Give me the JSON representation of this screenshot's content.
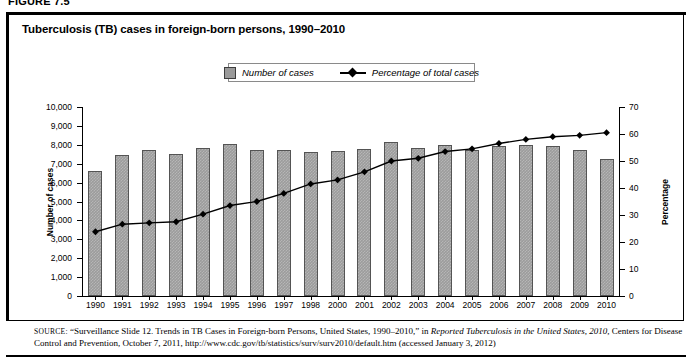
{
  "figure": {
    "number_label": "FIGURE 7.5",
    "title": "Tuberculosis (TB) cases in foreign-born persons, 1990–2010"
  },
  "legend": {
    "items": [
      {
        "label": "Number of cases",
        "marker": "gray-square",
        "color": "#9c9c9c"
      },
      {
        "label": "Percentage of total cases",
        "marker": "black-diamond-line",
        "color": "#000000"
      }
    ]
  },
  "axes": {
    "left_title": "Number of cases",
    "right_title": "Percentage",
    "left_ticks": [
      "10,000",
      "9,000",
      "8,000",
      "7,000",
      "6,000",
      "5,000",
      "4,000",
      "3,000",
      "2,000",
      "1,000",
      "0"
    ],
    "right_ticks": [
      "70",
      "60",
      "50",
      "40",
      "30",
      "20",
      "10",
      "0"
    ]
  },
  "source": {
    "label": "SOURCE:",
    "text_1": "“Surveillance Slide 12. Trends in TB Cases in Foreign-born Persons, United States, 1990–2010,” in ",
    "italic_1": "Reported Tuberculosis in the United States, 2010,",
    "text_2": " Centers for Disease Control and Prevention, October 7, 2011, http://www.cdc.gov/tb/statistics/surv/surv2010/default.htm (accessed January 3, 2012)"
  },
  "chart_data": {
    "type": "bar",
    "title": "Tuberculosis (TB) cases in foreign-born persons, 1990–2010",
    "xlabel": "",
    "ylabel": "Number of cases",
    "y2label": "Percentage",
    "ylim": [
      0,
      10000
    ],
    "y2lim": [
      0,
      70
    ],
    "grid": false,
    "legend_position": "top-center",
    "categories": [
      "1990",
      "1991",
      "1992",
      "1993",
      "1994",
      "1995",
      "1996",
      "1997",
      "1998",
      "2000",
      "2001",
      "2002",
      "2003",
      "2004",
      "2005",
      "2006",
      "2007",
      "2008",
      "2009",
      "2010"
    ],
    "series": [
      {
        "name": "Number of cases",
        "type": "bar",
        "axis": "left",
        "color": "#9c9c9c",
        "values": [
          6600,
          7450,
          7700,
          7500,
          7850,
          8050,
          7750,
          7700,
          7600,
          7650,
          7800,
          8150,
          7850,
          8000,
          7700,
          7950,
          8000,
          7950,
          7750,
          7250
        ]
      },
      {
        "name": "Percentage of total cases",
        "type": "line",
        "axis": "right",
        "color": "#000000",
        "values": [
          23.8,
          26.6,
          27.1,
          27.5,
          30.3,
          33.5,
          35.0,
          38.0,
          41.5,
          43.0,
          46.0,
          50.0,
          51.0,
          53.5,
          54.5,
          56.5,
          58.0,
          59.0,
          59.5,
          60.5
        ]
      }
    ]
  }
}
